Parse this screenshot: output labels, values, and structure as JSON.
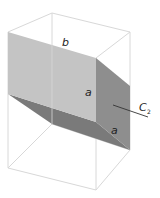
{
  "figure": {
    "labels": {
      "top_edge": "b",
      "vertical_edge": "a",
      "bottom_edge": "a",
      "axis_main": "C",
      "axis_sub": "2"
    },
    "colors": {
      "background": "#ffffff",
      "wireframe": "#d8d8d8",
      "face_light": "#c4c4c4",
      "face_right": "#8e8e8e",
      "face_bottom": "#7a7a7a",
      "axis_line": "#333333",
      "label": "#222222"
    }
  }
}
